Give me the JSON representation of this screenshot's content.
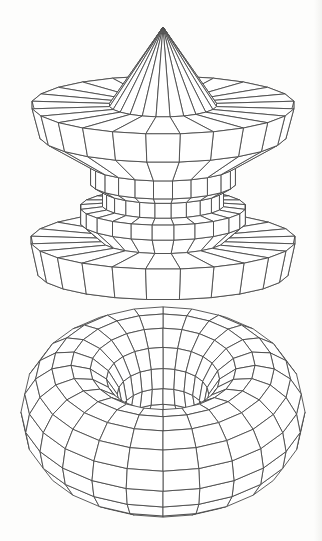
{
  "figure": {
    "background": "#fdfdfc",
    "line_color": "#4a4a4a",
    "fill_color": "#ffffff"
  },
  "models": [
    {
      "name": "spinning-top",
      "type": "lathe",
      "center_x": 163,
      "segments": 24,
      "tilt": 0.22,
      "profile": [
        {
          "r": 0,
          "y": 27
        },
        {
          "r": 54,
          "y": 105
        },
        {
          "r": 132,
          "y": 105
        },
        {
          "r": 124,
          "y": 135
        },
        {
          "r": 73,
          "y": 165
        },
        {
          "r": 73,
          "y": 183
        },
        {
          "r": 61,
          "y": 190
        },
        {
          "r": 61,
          "y": 205
        },
        {
          "r": 83,
          "y": 207
        },
        {
          "r": 83,
          "y": 222
        },
        {
          "r": 62,
          "y": 240
        },
        {
          "r": 133,
          "y": 240
        },
        {
          "r": 126,
          "y": 272
        },
        {
          "r": 0,
          "y": 272
        }
      ]
    },
    {
      "name": "torus",
      "type": "torus",
      "center_x": 163,
      "center_y": 412,
      "major_radius": 92,
      "minor_radius": 50,
      "major_segments": 24,
      "minor_segments": 16,
      "tilt": 0.36
    }
  ]
}
